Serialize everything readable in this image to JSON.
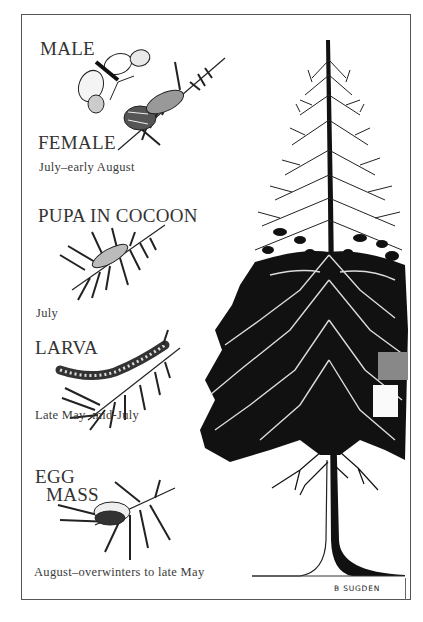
{
  "plate": {
    "stages": [
      {
        "title_lines": [
          "MALE"
        ],
        "role": "male-moth"
      },
      {
        "title_lines": [
          "FEMALE"
        ],
        "time": "July–early August",
        "role": "female-moth"
      },
      {
        "title_lines": [
          "PUPA IN COCOON"
        ],
        "time": "July",
        "role": "pupa"
      },
      {
        "title_lines": [
          "LARVA"
        ],
        "time": "Late May–mid-July",
        "role": "larva"
      },
      {
        "title_lines": [
          "EGG",
          "MASS"
        ],
        "time": "August–overwinters to late May",
        "role": "egg-mass"
      }
    ],
    "signature": "B SUGDEN",
    "colors": {
      "ink": "#111111",
      "paper": "#ffffff",
      "frame": "#555555",
      "patch_grey": "#888888"
    }
  }
}
